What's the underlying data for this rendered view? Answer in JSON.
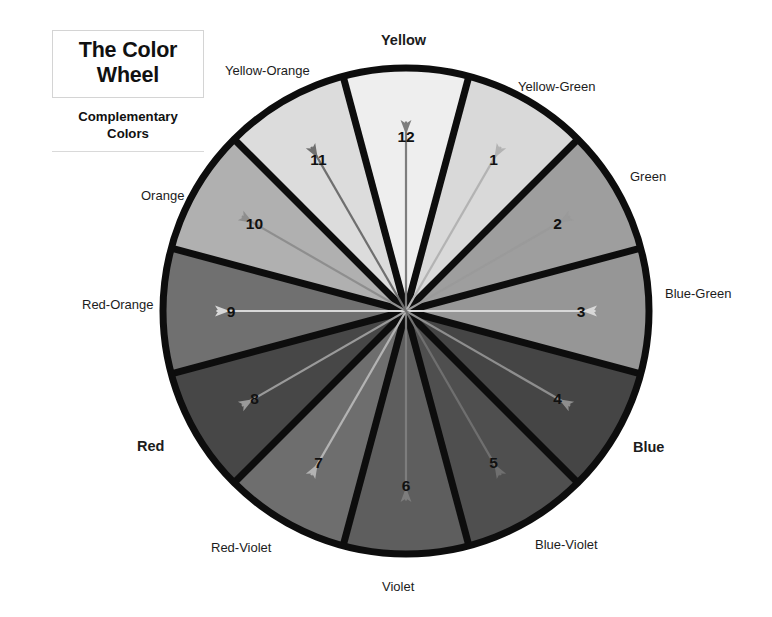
{
  "title": {
    "line1": "The Color",
    "line2": "Wheel",
    "sub1": "Complementary",
    "sub2": "Colors"
  },
  "wheel": {
    "center": {
      "x": 406,
      "y": 311
    },
    "radius": 243,
    "ring_stroke": "#0d0d0d",
    "ring_stroke_width": 7,
    "spoke_stroke": "#0d0d0d",
    "spoke_stroke_width": 7,
    "segment_count": 12,
    "number_color_light_bg": "#111111",
    "number_color_dark_bg": "#111111"
  },
  "segments": [
    {
      "number": "12",
      "name": "Yellow",
      "fill": "#eeeeee",
      "angle_center_deg": 0,
      "label_bold": true
    },
    {
      "number": "1",
      "name": "Yellow-Green",
      "fill": "#d9d9d9",
      "angle_center_deg": 30,
      "label_bold": false
    },
    {
      "number": "2",
      "name": "Green",
      "fill": "#9e9e9e",
      "angle_center_deg": 60,
      "label_bold": false
    },
    {
      "number": "3",
      "name": "Blue-Green",
      "fill": "#969696",
      "angle_center_deg": 90,
      "label_bold": false
    },
    {
      "number": "4",
      "name": "Blue",
      "fill": "#454545",
      "angle_center_deg": 120,
      "label_bold": true
    },
    {
      "number": "5",
      "name": "Blue-Violet",
      "fill": "#4f4f4f",
      "angle_center_deg": 150,
      "label_bold": false
    },
    {
      "number": "6",
      "name": "Violet",
      "fill": "#5e5e5e",
      "angle_center_deg": 180,
      "label_bold": false
    },
    {
      "number": "7",
      "name": "Red-Violet",
      "fill": "#6e6e6e",
      "angle_center_deg": 210,
      "label_bold": false
    },
    {
      "number": "8",
      "name": "Red",
      "fill": "#474747",
      "angle_center_deg": 240,
      "label_bold": true
    },
    {
      "number": "9",
      "name": "Red-Orange",
      "fill": "#707070",
      "angle_center_deg": 270,
      "label_bold": false
    },
    {
      "number": "10",
      "name": "Orange",
      "fill": "#b0b0b0",
      "angle_center_deg": 300,
      "label_bold": false
    },
    {
      "number": "11",
      "name": "Yellow-Orange",
      "fill": "#dcdcdc",
      "angle_center_deg": 330,
      "label_bold": false
    }
  ],
  "complementary_pairs": [
    {
      "from": "12",
      "to": "6",
      "from_name": "Yellow",
      "to_name": "Violet",
      "stroke": "#7d7d7d"
    },
    {
      "from": "1",
      "to": "7",
      "from_name": "Yellow-Green",
      "to_name": "Red-Violet",
      "stroke": "#b3b3b3"
    },
    {
      "from": "2",
      "to": "8",
      "from_name": "Green",
      "to_name": "Red",
      "stroke": "#9a9a9a"
    },
    {
      "from": "3",
      "to": "9",
      "from_name": "Blue-Green",
      "to_name": "Red-Orange",
      "stroke": "#d8d8d8"
    },
    {
      "from": "4",
      "to": "10",
      "from_name": "Blue",
      "to_name": "Orange",
      "stroke": "#8e8e8e"
    },
    {
      "from": "5",
      "to": "11",
      "from_name": "Blue-Violet",
      "to_name": "Yellow-Orange",
      "stroke": "#6f6f6f"
    }
  ],
  "outer_labels": [
    {
      "text": "Yellow",
      "x": 381,
      "y": 33,
      "bold": true
    },
    {
      "text": "Yellow-Green",
      "x": 518,
      "y": 80,
      "bold": false
    },
    {
      "text": "Green",
      "x": 630,
      "y": 170,
      "bold": false
    },
    {
      "text": "Blue-Green",
      "x": 665,
      "y": 287,
      "bold": false
    },
    {
      "text": "Blue",
      "x": 633,
      "y": 440,
      "bold": true
    },
    {
      "text": "Blue-Violet",
      "x": 535,
      "y": 538,
      "bold": false
    },
    {
      "text": "Violet",
      "x": 382,
      "y": 580,
      "bold": false
    },
    {
      "text": "Red-Violet",
      "x": 211,
      "y": 541,
      "bold": false
    },
    {
      "text": "Red",
      "x": 137,
      "y": 439,
      "bold": true
    },
    {
      "text": "Red-Orange",
      "x": 82,
      "y": 298,
      "bold": false
    },
    {
      "text": "Orange",
      "x": 141,
      "y": 189,
      "bold": false
    },
    {
      "text": "Yellow-Orange",
      "x": 225,
      "y": 64,
      "bold": false
    }
  ]
}
